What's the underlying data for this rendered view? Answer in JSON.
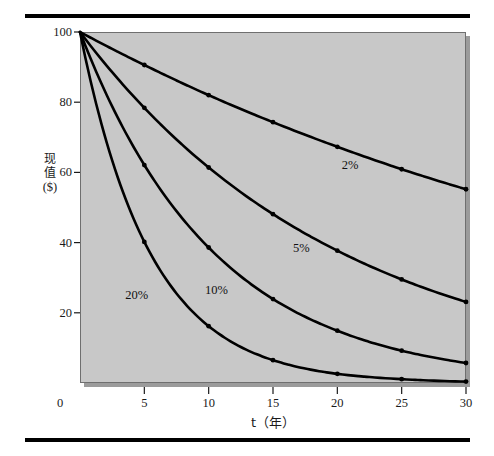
{
  "figure": {
    "background_color": "#ffffff",
    "plot_background_color": "#c8c8c8",
    "curve_color": "#000000",
    "rule_color": "#000000"
  },
  "axes": {
    "y_title_line1": "现",
    "y_title_line2": "值",
    "y_title_unit": "($)",
    "x_title": "t（年）",
    "y_ticks": [
      "100",
      "80",
      "60",
      "40",
      "20"
    ],
    "x_ticks": [
      "0",
      "5",
      "10",
      "15",
      "20",
      "25",
      "30"
    ],
    "origin_label": "0"
  },
  "chart_data": {
    "type": "line",
    "title": "",
    "subtitle": "",
    "xlabel": "t（年）",
    "ylabel": "现值 ($)",
    "xlim": [
      0,
      30
    ],
    "ylim": [
      0,
      100
    ],
    "grid": false,
    "legend_position": "inline-annotations",
    "x": [
      0,
      5,
      10,
      15,
      20,
      25,
      30
    ],
    "series": [
      {
        "name": "2%",
        "label": "2%",
        "label_x": 21.0,
        "label_y": 62.0,
        "values": [
          100,
          90.6,
          82.0,
          74.3,
          67.3,
          60.9,
          55.2
        ]
      },
      {
        "name": "5%",
        "label": "5%",
        "label_x": 17.2,
        "label_y": 38.5,
        "values": [
          100,
          78.4,
          61.4,
          48.1,
          37.7,
          29.5,
          23.1
        ]
      },
      {
        "name": "10%",
        "label": "10%",
        "label_x": 10.6,
        "label_y": 26.5,
        "values": [
          100,
          62.1,
          38.6,
          23.9,
          14.9,
          9.2,
          5.7
        ]
      },
      {
        "name": "20%",
        "label": "20%",
        "label_x": 4.4,
        "label_y": 25.0,
        "values": [
          100,
          40.2,
          16.2,
          6.5,
          2.6,
          1.1,
          0.4
        ]
      }
    ],
    "annotations": [
      "2%",
      "5%",
      "10%",
      "20%"
    ]
  }
}
